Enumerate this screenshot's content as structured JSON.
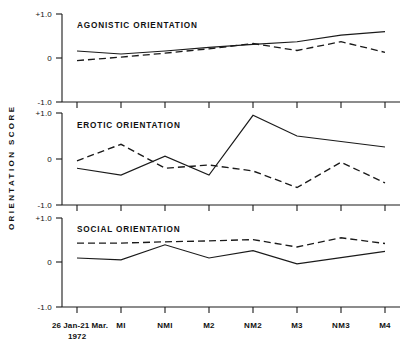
{
  "chart_data": {
    "type": "line",
    "title": "",
    "xlabel": "",
    "ylabel": "ORIENTATION SCORE",
    "ylim": [
      -1.0,
      1.0
    ],
    "grid": false,
    "legend_position": "none",
    "x_tick_labels": [
      "26 Jan-21 Mar.",
      "MI",
      "NMI",
      "M2",
      "NM2",
      "M3",
      "NM3",
      "M4"
    ],
    "x_tick_sublabel": "1972",
    "y_tick_labels": [
      "+1.0",
      "0",
      "-1.0"
    ],
    "y_tick_values": [
      1.0,
      0.0,
      -1.0
    ],
    "panels": [
      {
        "name": "agonistic",
        "title": "AGONISTIC  ORIENTATION",
        "series": [
          {
            "name": "solid-line",
            "style": "solid",
            "values": [
              0.16,
              0.09,
              0.16,
              0.24,
              0.31,
              0.37,
              0.52,
              0.6
            ]
          },
          {
            "name": "dashed-line",
            "style": "dashed",
            "values": [
              -0.06,
              0.02,
              0.11,
              0.21,
              0.33,
              0.17,
              0.37,
              0.13
            ]
          }
        ]
      },
      {
        "name": "erotic",
        "title": "EROTIC  ORIENTATION",
        "series": [
          {
            "name": "solid-line",
            "style": "solid",
            "values": [
              -0.2,
              -0.35,
              0.06,
              -0.35,
              0.95,
              0.5,
              0.38,
              0.26
            ]
          },
          {
            "name": "dashed-line",
            "style": "dashed",
            "values": [
              -0.04,
              0.32,
              -0.2,
              -0.13,
              -0.26,
              -0.62,
              -0.07,
              -0.52
            ]
          }
        ]
      },
      {
        "name": "social",
        "title": "SOCIAL  ORIENTATION",
        "series": [
          {
            "name": "solid-line",
            "style": "solid",
            "values": [
              0.09,
              0.05,
              0.39,
              0.09,
              0.26,
              -0.04,
              0.1,
              0.24
            ]
          },
          {
            "name": "dashed-line",
            "style": "dashed",
            "values": [
              0.43,
              0.43,
              0.46,
              0.48,
              0.51,
              0.34,
              0.55,
              0.42
            ]
          }
        ]
      }
    ]
  }
}
